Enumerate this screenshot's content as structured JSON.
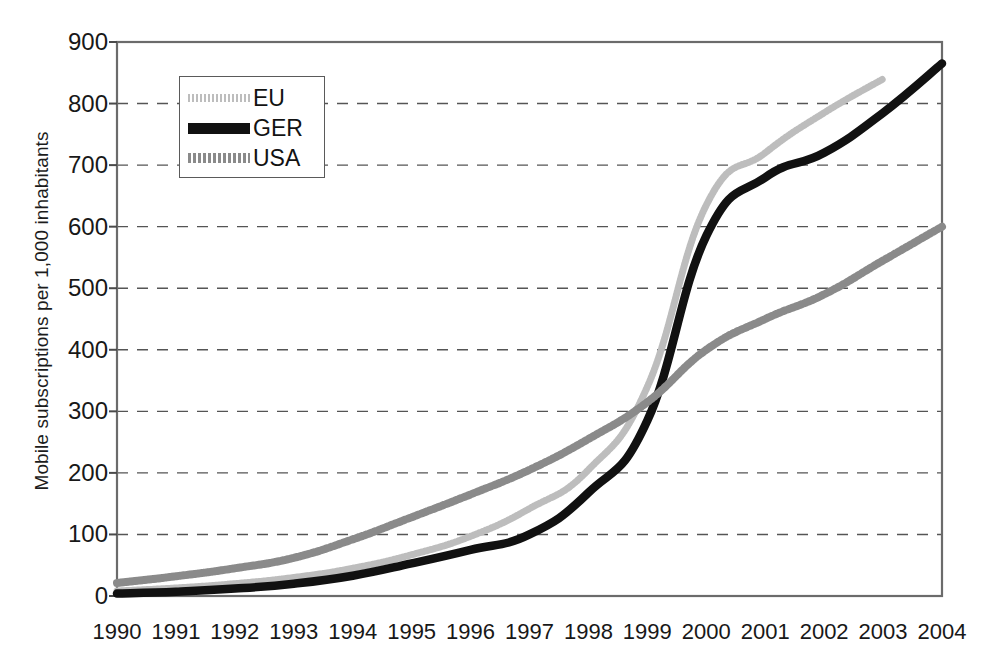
{
  "chart_data": {
    "type": "line",
    "title": "",
    "xlabel": "",
    "ylabel": "Mobile subscriptions per 1,000 inhabitants",
    "x": [
      1990,
      1991,
      1992,
      1993,
      1994,
      1995,
      1996,
      1997,
      1998,
      1999,
      2000,
      2001,
      2002,
      2003,
      2004
    ],
    "xtick_labels": [
      "1990",
      "1991",
      "1992",
      "1993",
      "1994",
      "1995",
      "1996",
      "1997",
      "1998",
      "1999",
      "2000",
      "2001",
      "2002",
      "2003",
      "2004"
    ],
    "ytick_labels": [
      "0",
      "100",
      "200",
      "300",
      "400",
      "500",
      "600",
      "700",
      "800",
      "900"
    ],
    "yticks": [
      0,
      100,
      200,
      300,
      400,
      500,
      600,
      700,
      800,
      900
    ],
    "ylim": [
      0,
      900
    ],
    "xlim": [
      1990,
      2004
    ],
    "grid": "horizontal-dashed",
    "legend_position": "upper-left-inside",
    "series": [
      {
        "name": "EU",
        "color": "#bdbdbd",
        "style": "dotted-thick",
        "x": [
          1990,
          1991,
          1992,
          1993,
          1994,
          1995,
          1996,
          1997,
          1998,
          1999,
          2000,
          2001,
          2002,
          2003
        ],
        "values": [
          8,
          13,
          20,
          30,
          45,
          67,
          97,
          142,
          205,
          340,
          635,
          720,
          785,
          840
        ]
      },
      {
        "name": "GER",
        "color": "#111111",
        "style": "solid-bold",
        "x": [
          1990,
          1991,
          1992,
          1993,
          1994,
          1995,
          1996,
          1997,
          1998,
          1999,
          2000,
          2001,
          2002,
          2003,
          2004
        ],
        "values": [
          4,
          7,
          12,
          20,
          33,
          53,
          75,
          100,
          168,
          285,
          585,
          680,
          720,
          785,
          865
        ]
      },
      {
        "name": "USA",
        "color": "#8a8a8a",
        "style": "checkered-thick",
        "x": [
          1990,
          1991,
          1992,
          1993,
          1994,
          1995,
          1996,
          1997,
          1998,
          1999,
          2000,
          2001,
          2002,
          2003,
          2004
        ],
        "values": [
          21,
          32,
          45,
          62,
          92,
          128,
          165,
          205,
          255,
          315,
          400,
          450,
          490,
          545,
          600
        ]
      }
    ]
  },
  "axis": {
    "ylabel": "Mobile subscriptions per 1,000 inhabitants"
  },
  "legend": {
    "items": [
      {
        "label": "EU"
      },
      {
        "label": "GER"
      },
      {
        "label": "USA"
      }
    ]
  }
}
